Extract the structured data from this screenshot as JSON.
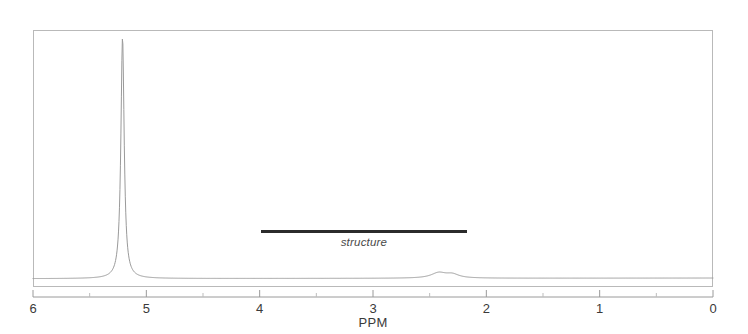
{
  "chart_data": {
    "type": "line",
    "title": "",
    "subtitle": "",
    "xlabel": "PPM",
    "ylabel": "",
    "xlim": [
      6,
      0
    ],
    "ylim": [
      0,
      1
    ],
    "x_axis_reversed": true,
    "grid": false,
    "legend": null,
    "tick_labels": [
      "6",
      "5",
      "4",
      "3",
      "2",
      "1",
      "0"
    ],
    "major_ticks": [
      6,
      5,
      4,
      3,
      2,
      1,
      0
    ],
    "minor_ticks": [
      5.5,
      4.5,
      3.5,
      2.5,
      1.5,
      0.5
    ],
    "series": [
      {
        "name": "1H NMR trace",
        "color": "#9a9a9a",
        "peaks": [
          {
            "ppm": 5.21,
            "relative_height": 1.0,
            "width_ppm": 0.035,
            "label": ""
          },
          {
            "ppm": 2.42,
            "relative_height": 0.022,
            "width_ppm": 0.16,
            "label": ""
          },
          {
            "ppm": 2.3,
            "relative_height": 0.015,
            "width_ppm": 0.14,
            "label": ""
          }
        ],
        "baseline_level": 0.004
      }
    ],
    "annotations": [
      {
        "kind": "range-bar",
        "text": "structure",
        "ppm_start": 3.99,
        "ppm_end": 2.17,
        "color": "#2b2b2b",
        "text_color": "#4a4a4a",
        "text_style": "italic"
      }
    ]
  },
  "figure": {
    "frame_color": "#b9b9b9",
    "background_color": "#ffffff",
    "trace_color": "#9a9a9a",
    "axis_color": "#9a9a9a",
    "tick_color": "#b0b0b0",
    "text_color": "#3a3a3a"
  },
  "axis": {
    "title": "PPM",
    "ticks": [
      {
        "label": "6",
        "value": 6
      },
      {
        "label": "5",
        "value": 5
      },
      {
        "label": "4",
        "value": 4
      },
      {
        "label": "3",
        "value": 3
      },
      {
        "label": "2",
        "value": 2
      },
      {
        "label": "1",
        "value": 1
      },
      {
        "label": "0",
        "value": 0
      }
    ]
  },
  "annotation": {
    "structure_label": "structure"
  }
}
